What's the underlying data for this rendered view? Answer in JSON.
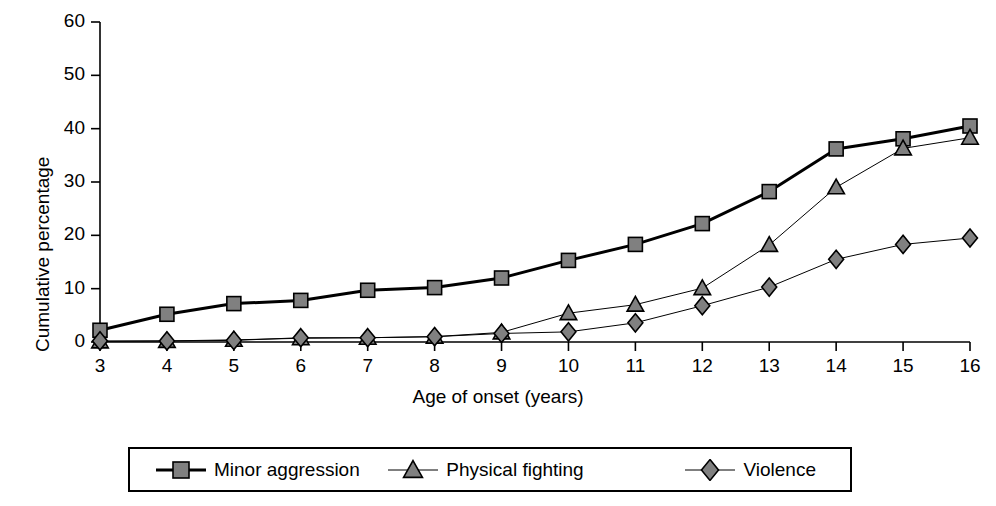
{
  "chart_data": {
    "type": "line",
    "title": "",
    "xlabel": "Age of onset (years)",
    "ylabel": "Cumulative percentage",
    "x": [
      3,
      4,
      5,
      6,
      7,
      8,
      9,
      10,
      11,
      12,
      13,
      14,
      15,
      16
    ],
    "categories": [
      "3",
      "4",
      "5",
      "6",
      "7",
      "8",
      "9",
      "10",
      "11",
      "12",
      "13",
      "14",
      "15",
      "16"
    ],
    "xlim": [
      3,
      16
    ],
    "ylim": [
      0,
      60
    ],
    "yticks": [
      0,
      10,
      20,
      30,
      40,
      50,
      60
    ],
    "ytick_labels": [
      "0",
      "10",
      "20",
      "30",
      "40",
      "50",
      "60"
    ],
    "grid": false,
    "legend_position": "bottom",
    "series": [
      {
        "name": "Minor aggression",
        "marker": "square",
        "color": "#808080",
        "line_color": "#000000",
        "line_width": 3,
        "values": [
          2.2,
          5.2,
          7.2,
          7.8,
          9.7,
          10.2,
          12.0,
          15.3,
          18.3,
          22.2,
          28.2,
          36.2,
          38.1,
          40.5
        ]
      },
      {
        "name": "Physical fighting",
        "marker": "triangle",
        "color": "#808080",
        "line_color": "#000000",
        "line_width": 1,
        "values": [
          0.1,
          0.2,
          0.4,
          0.7,
          0.8,
          1.0,
          1.8,
          5.4,
          7.0,
          10.1,
          18.2,
          29.0,
          36.3,
          38.3
        ]
      },
      {
        "name": "Violence",
        "marker": "diamond",
        "color": "#808080",
        "line_color": "#000000",
        "line_width": 1,
        "values": [
          0.2,
          0.2,
          0.3,
          0.8,
          0.8,
          1.0,
          1.6,
          1.9,
          3.6,
          6.8,
          10.3,
          15.5,
          18.3,
          19.5
        ]
      }
    ]
  },
  "legend": {
    "entries": [
      {
        "label": "Minor aggression",
        "marker": "square"
      },
      {
        "label": "Physical fighting",
        "marker": "triangle"
      },
      {
        "label": "Violence",
        "marker": "diamond"
      }
    ]
  },
  "colors": {
    "marker_fill": "#808080",
    "axis": "#000000",
    "background": "#ffffff"
  }
}
